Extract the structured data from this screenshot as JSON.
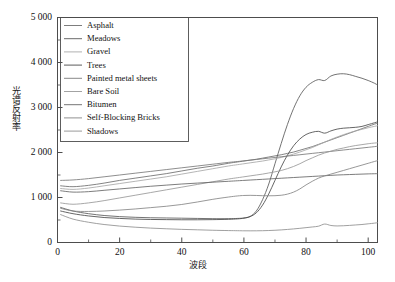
{
  "chart_data": {
    "type": "line",
    "title": "",
    "xlabel": "波段",
    "ylabel": "光谱反射率",
    "xlim": [
      0,
      103
    ],
    "ylim": [
      0,
      5000
    ],
    "grid": false,
    "legend_position": "upper-left-inside",
    "x_ticks": [
      "0",
      "20",
      "40",
      "60",
      "80",
      "100"
    ],
    "x_tick_values": [
      0,
      20,
      40,
      60,
      80,
      100
    ],
    "x_minor_step": 10,
    "y_ticks": [
      "0",
      "1 000",
      "2 000",
      "3 000",
      "4 000",
      "5 000"
    ],
    "y_tick_values": [
      0,
      1000,
      2000,
      3000,
      4000,
      5000
    ],
    "y_minor_step": 500,
    "x": [
      1,
      5,
      10,
      15,
      20,
      25,
      30,
      35,
      40,
      45,
      50,
      55,
      58,
      60,
      62,
      64,
      66,
      68,
      70,
      72,
      74,
      76,
      78,
      80,
      82,
      84,
      86,
      88,
      90,
      92,
      94,
      96,
      98,
      100,
      102,
      103
    ],
    "series": [
      {
        "name": "Asphalt",
        "color": "#6e6e6e",
        "values": [
          1260,
          1240,
          1270,
          1320,
          1380,
          1430,
          1480,
          1530,
          1590,
          1650,
          1700,
          1760,
          1790,
          1810,
          1830,
          1850,
          1875,
          1900,
          1925,
          1950,
          1980,
          2010,
          2050,
          2090,
          2130,
          2180,
          2230,
          2280,
          2330,
          2380,
          2430,
          2480,
          2530,
          2580,
          2630,
          2650
        ]
      },
      {
        "name": "Meadows",
        "color": "#5a5a5a",
        "values": [
          780,
          700,
          640,
          600,
          575,
          560,
          550,
          545,
          540,
          535,
          530,
          530,
          535,
          545,
          580,
          700,
          950,
          1300,
          1750,
          2200,
          2620,
          2980,
          3260,
          3450,
          3560,
          3620,
          3600,
          3700,
          3740,
          3750,
          3730,
          3690,
          3650,
          3600,
          3540,
          3500
        ]
      },
      {
        "name": "Gravel",
        "color": "#a8a8a8",
        "values": [
          1200,
          1180,
          1210,
          1260,
          1310,
          1360,
          1410,
          1460,
          1520,
          1580,
          1640,
          1700,
          1730,
          1750,
          1770,
          1790,
          1810,
          1835,
          1860,
          1890,
          1925,
          1965,
          2010,
          2060,
          2110,
          2170,
          2230,
          2290,
          2345,
          2395,
          2440,
          2480,
          2515,
          2550,
          2580,
          2595
        ]
      },
      {
        "name": "Trees",
        "color": "#4a4a4a",
        "values": [
          700,
          640,
          590,
          555,
          535,
          520,
          512,
          508,
          505,
          505,
          508,
          515,
          525,
          540,
          575,
          660,
          830,
          1080,
          1380,
          1680,
          1940,
          2150,
          2300,
          2400,
          2450,
          2470,
          2430,
          2480,
          2520,
          2540,
          2550,
          2560,
          2580,
          2620,
          2660,
          2680
        ]
      },
      {
        "name": "Painted metal sheets",
        "color": "#7a7a7a",
        "values": [
          1380,
          1390,
          1420,
          1460,
          1500,
          1540,
          1580,
          1620,
          1660,
          1700,
          1740,
          1780,
          1800,
          1815,
          1830,
          1845,
          1860,
          1875,
          1890,
          1905,
          1920,
          1935,
          1950,
          1965,
          1980,
          1995,
          2010,
          2025,
          2040,
          2055,
          2070,
          2085,
          2100,
          2115,
          2130,
          2140
        ]
      },
      {
        "name": "Bare Soil",
        "color": "#989898",
        "values": [
          880,
          850,
          880,
          930,
          990,
          1050,
          1110,
          1170,
          1230,
          1290,
          1350,
          1410,
          1440,
          1460,
          1480,
          1500,
          1520,
          1545,
          1570,
          1600,
          1640,
          1690,
          1750,
          1820,
          1880,
          1940,
          1990,
          2030,
          2070,
          2100,
          2130,
          2155,
          2175,
          2195,
          2210,
          2215
        ]
      },
      {
        "name": "Bitumen",
        "color": "#666666",
        "values": [
          1150,
          1120,
          1130,
          1160,
          1190,
          1220,
          1250,
          1275,
          1300,
          1320,
          1340,
          1360,
          1372,
          1380,
          1388,
          1396,
          1404,
          1412,
          1420,
          1428,
          1436,
          1444,
          1452,
          1460,
          1468,
          1476,
          1484,
          1492,
          1500,
          1505,
          1510,
          1515,
          1520,
          1525,
          1528,
          1530
        ]
      },
      {
        "name": "Self-Blocking Bricks",
        "color": "#858585",
        "values": [
          760,
          700,
          690,
          700,
          720,
          745,
          775,
          805,
          845,
          900,
          960,
          1010,
          1035,
          1045,
          1048,
          1045,
          1040,
          1038,
          1040,
          1050,
          1075,
          1120,
          1190,
          1280,
          1360,
          1430,
          1480,
          1520,
          1560,
          1600,
          1640,
          1680,
          1720,
          1760,
          1800,
          1820
        ]
      },
      {
        "name": "Shadows",
        "color": "#8f8f8f",
        "values": [
          620,
          520,
          450,
          400,
          365,
          340,
          320,
          305,
          292,
          282,
          272,
          265,
          262,
          260,
          259,
          260,
          262,
          266,
          272,
          280,
          290,
          302,
          315,
          330,
          345,
          362,
          410,
          378,
          368,
          372,
          380,
          390,
          400,
          415,
          430,
          440
        ]
      }
    ]
  },
  "legend": {
    "items": [
      {
        "label": "Asphalt"
      },
      {
        "label": "Meadows"
      },
      {
        "label": "Gravel"
      },
      {
        "label": "Trees"
      },
      {
        "label": "Painted metal sheets"
      },
      {
        "label": "Bare Soil"
      },
      {
        "label": "Bitumen"
      },
      {
        "label": "Self-Blocking Bricks"
      },
      {
        "label": "Shadows"
      }
    ]
  },
  "axes": {
    "y_title": "光谱反射率",
    "x_title": "波段"
  }
}
